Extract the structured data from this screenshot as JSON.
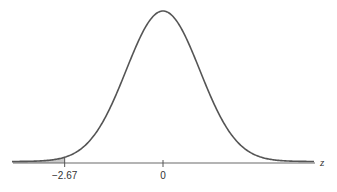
{
  "chart_data": {
    "type": "area",
    "title": "",
    "distribution": {
      "name": "standard normal",
      "mean": 0,
      "sd": 1
    },
    "xlabel": "z",
    "ylabel": "",
    "xlim": [
      -4.1,
      4.1
    ],
    "grid": false,
    "legend": "none",
    "ticks": [
      {
        "value": -2.67,
        "label": "−2.67"
      },
      {
        "value": 0,
        "label": "0"
      }
    ],
    "shaded_region": {
      "from": "-inf",
      "to": -2.67,
      "tail": "left",
      "color": "#c8c8c8"
    },
    "colors": {
      "curve": "#555555",
      "axis": "#6a6a6a",
      "shade": "#c8c8c8"
    }
  }
}
